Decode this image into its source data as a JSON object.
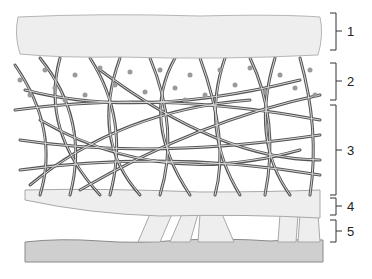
{
  "diagram": {
    "type": "layered cross-section",
    "colors": {
      "layer_fill": "#eeeeee",
      "layer_edge": "#a8a8a8",
      "fiber": "#555555",
      "fiber_inner": "#d8d8d8",
      "dots": "#9a9a9a",
      "base_fill": "#cfcfcf",
      "bracket": "#333333"
    },
    "layers": [
      {
        "id": 1,
        "label": "1",
        "description": "top textured layer"
      },
      {
        "id": 2,
        "label": "2",
        "description": "fiber network with dots"
      },
      {
        "id": 3,
        "label": "3",
        "description": "dense fiber network"
      },
      {
        "id": 4,
        "label": "4",
        "description": "lower textured layer"
      },
      {
        "id": 5,
        "label": "5",
        "description": "pillars connecting to base"
      }
    ]
  }
}
